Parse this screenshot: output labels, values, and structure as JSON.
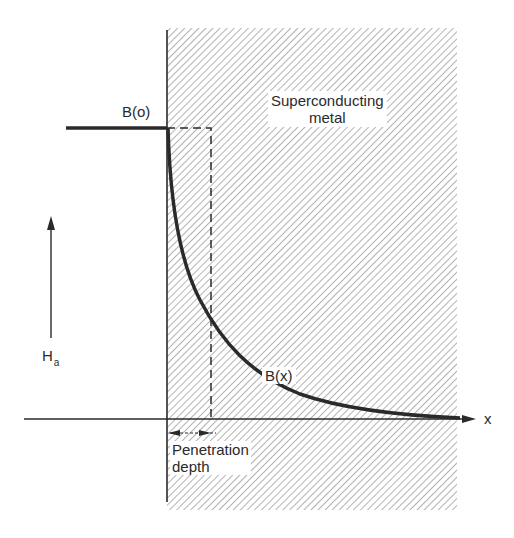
{
  "diagram": {
    "labels": {
      "region": [
        "Superconducting",
        "metal"
      ],
      "surface_field": "B(o)",
      "internal_field": "B(x)",
      "applied_field_main": "H",
      "applied_field_sub": "a",
      "axis": "x",
      "penetration": [
        "Penetration",
        "depth"
      ]
    },
    "colors": {
      "ink": "#2a2a2a",
      "hatch": "#8a8a8a",
      "background": "#ffffff"
    },
    "curve": {
      "type": "exponential decay",
      "expression": "B(x) = B(o) exp(-x / lambda)"
    }
  }
}
